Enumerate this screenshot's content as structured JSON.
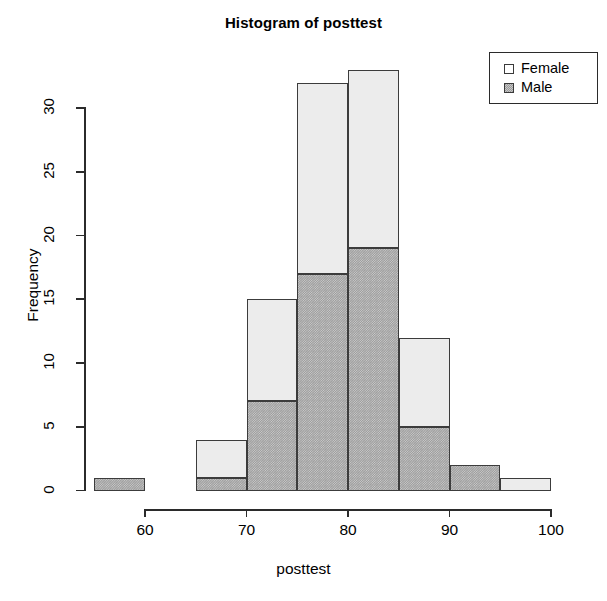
{
  "chart_data": {
    "type": "bar",
    "title": "Histogram of posttest",
    "xlabel": "posttest",
    "ylabel": "Frequency",
    "stacked": true,
    "grid": false,
    "legend_position": "top-right",
    "xlim": [
      55,
      100
    ],
    "ylim": [
      0,
      33
    ],
    "xticks": [
      60,
      70,
      80,
      90,
      100
    ],
    "yticks": [
      0,
      5,
      10,
      15,
      20,
      25,
      30
    ],
    "bin_width": 5,
    "bin_edges": [
      55,
      60,
      65,
      70,
      75,
      80,
      85,
      90,
      95,
      100
    ],
    "categories": [
      "55-60",
      "60-65",
      "65-70",
      "70-75",
      "75-80",
      "80-85",
      "85-90",
      "90-95",
      "95-100"
    ],
    "series": [
      {
        "name": "Female",
        "color": "#ececec",
        "values": [
          0,
          0,
          3,
          8,
          15,
          14,
          7,
          0,
          1
        ]
      },
      {
        "name": "Male",
        "color": "#9e9e9e",
        "values": [
          1,
          0,
          1,
          7,
          17,
          19,
          5,
          2,
          0
        ]
      }
    ],
    "totals": [
      1,
      0,
      4,
      15,
      32,
      33,
      12,
      2,
      1
    ]
  },
  "legend": {
    "items": [
      {
        "label": "Female",
        "swatch": "legend-swatch-female"
      },
      {
        "label": "Male",
        "swatch": "legend-swatch-male"
      }
    ]
  },
  "axes": {
    "y": {
      "title": "Frequency",
      "ticks": [
        "0",
        "5",
        "10",
        "15",
        "20",
        "25",
        "30"
      ]
    },
    "x": {
      "title": "posttest",
      "ticks": [
        "60",
        "70",
        "80",
        "90",
        "100"
      ]
    }
  }
}
